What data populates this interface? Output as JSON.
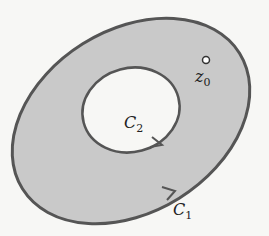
{
  "diagram": {
    "outer_contour": {
      "label": "C",
      "subscript": "1"
    },
    "inner_contour": {
      "label": "C",
      "subscript": "2"
    },
    "point": {
      "label": "z",
      "subscript": "0"
    },
    "colors": {
      "region_fill": "#c9c9c9",
      "stroke": "#555555",
      "hole_fill": "#f7f7f5"
    }
  }
}
